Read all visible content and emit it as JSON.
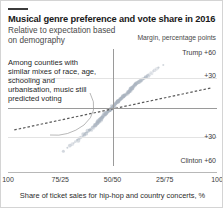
{
  "chart_data": {
    "type": "scatter",
    "title": "Musical genre preference and vote share in 2016",
    "subtitle": "Relative to expectation based on demography",
    "unit_label": "Margin, percentage points",
    "xlabel": "Share of ticket sales for hip-hop and country concerts, %",
    "ylabel": "Margin, percentage points",
    "annotation": "Among counties with similar mixes of race, age, schooling and urbanisation, music still predicted voting",
    "x_ticks": [
      "100",
      "75/25",
      "50/50",
      "25/75",
      "100"
    ],
    "x_tick_positions": [
      0,
      25,
      50,
      75,
      100
    ],
    "y_ticks": [
      "Trump +60",
      "+30",
      "+30",
      "Clinton +60"
    ],
    "y_tick_values": [
      60,
      30,
      -30,
      -60
    ],
    "ylim": [
      -60,
      60
    ],
    "xlim": [
      0,
      100
    ],
    "grid": true,
    "legend": "none",
    "point_color": "#aab4c0",
    "trend_color": "#5a5a5a",
    "axis_color": "#9a9a9a",
    "accent_color": "#3b3b3b",
    "trend_line": {
      "style": "dashed",
      "x_start": 3,
      "y_start": -23,
      "x_end": 97,
      "y_end": 20
    },
    "points": [
      {
        "x": 50.8,
        "y": 3.1
      },
      {
        "x": 47.2,
        "y": -5.4
      },
      {
        "x": 53.6,
        "y": 8.2
      },
      {
        "x": 44.1,
        "y": -11.3
      },
      {
        "x": 56.9,
        "y": 14.7
      },
      {
        "x": 49.5,
        "y": 1.8
      },
      {
        "x": 41.3,
        "y": -17.2
      },
      {
        "x": 58.4,
        "y": 19.6
      },
      {
        "x": 52.2,
        "y": 6.5
      },
      {
        "x": 46.7,
        "y": -7.9
      },
      {
        "x": 55.1,
        "y": 11.4
      },
      {
        "x": 43.0,
        "y": -14.1
      },
      {
        "x": 60.2,
        "y": 22.8
      },
      {
        "x": 48.3,
        "y": -2.6
      },
      {
        "x": 51.7,
        "y": 4.9
      },
      {
        "x": 38.6,
        "y": -24.5
      },
      {
        "x": 62.7,
        "y": 26.3
      },
      {
        "x": 54.4,
        "y": 9.7
      },
      {
        "x": 45.2,
        "y": -9.8
      },
      {
        "x": 57.3,
        "y": 16.1
      },
      {
        "x": 50.1,
        "y": 0.4
      },
      {
        "x": 40.5,
        "y": -20.3
      },
      {
        "x": 59.6,
        "y": 21.2
      },
      {
        "x": 53.0,
        "y": 7.3
      },
      {
        "x": 47.8,
        "y": -4.1
      },
      {
        "x": 35.9,
        "y": -29.7
      },
      {
        "x": 65.1,
        "y": 30.4
      },
      {
        "x": 49.0,
        "y": -1.2
      },
      {
        "x": 52.8,
        "y": 5.8
      },
      {
        "x": 42.4,
        "y": -15.6
      },
      {
        "x": 61.0,
        "y": 24.1
      },
      {
        "x": 55.7,
        "y": 12.9
      },
      {
        "x": 44.8,
        "y": -10.5
      },
      {
        "x": 58.0,
        "y": 17.8
      },
      {
        "x": 50.5,
        "y": 2.2
      },
      {
        "x": 39.2,
        "y": -22.9
      },
      {
        "x": 63.4,
        "y": 27.6
      },
      {
        "x": 53.9,
        "y": 8.9
      },
      {
        "x": 46.1,
        "y": -6.7
      },
      {
        "x": 56.2,
        "y": 13.5
      },
      {
        "x": 48.7,
        "y": -3.3
      },
      {
        "x": 37.4,
        "y": -26.8
      },
      {
        "x": 66.8,
        "y": 33.1
      },
      {
        "x": 51.3,
        "y": 3.7
      },
      {
        "x": 43.7,
        "y": -12.8
      },
      {
        "x": 59.1,
        "y": 20.0
      },
      {
        "x": 54.9,
        "y": 10.6
      },
      {
        "x": 45.6,
        "y": -8.6
      },
      {
        "x": 57.8,
        "y": 15.3
      },
      {
        "x": 33.1,
        "y": -33.2
      },
      {
        "x": 68.3,
        "y": 35.8
      },
      {
        "x": 50.9,
        "y": 1.1
      },
      {
        "x": 52.5,
        "y": 6.0
      },
      {
        "x": 41.8,
        "y": -18.4
      },
      {
        "x": 60.7,
        "y": 23.3
      },
      {
        "x": 55.4,
        "y": 11.0
      },
      {
        "x": 47.5,
        "y": -5.1
      },
      {
        "x": 58.8,
        "y": 18.6
      },
      {
        "x": 49.8,
        "y": -0.5
      },
      {
        "x": 36.6,
        "y": -28.1
      },
      {
        "x": 64.2,
        "y": 28.9
      },
      {
        "x": 53.3,
        "y": 7.8
      },
      {
        "x": 44.4,
        "y": -13.4
      },
      {
        "x": 56.5,
        "y": 13.0
      },
      {
        "x": 48.0,
        "y": -3.9
      },
      {
        "x": 30.8,
        "y": -37.5
      },
      {
        "x": 70.1,
        "y": 38.2
      },
      {
        "x": 51.0,
        "y": 2.7
      },
      {
        "x": 42.9,
        "y": -16.0
      },
      {
        "x": 61.6,
        "y": 25.0
      },
      {
        "x": 54.1,
        "y": 9.2
      },
      {
        "x": 46.4,
        "y": -7.2
      },
      {
        "x": 57.0,
        "y": 14.2
      },
      {
        "x": 50.3,
        "y": 0.9
      },
      {
        "x": 34.5,
        "y": -31.0
      },
      {
        "x": 67.0,
        "y": 32.4
      },
      {
        "x": 52.9,
        "y": 6.8
      },
      {
        "x": 45.0,
        "y": -10.0
      },
      {
        "x": 59.4,
        "y": 19.1
      },
      {
        "x": 49.2,
        "y": -1.9
      },
      {
        "x": 39.8,
        "y": -21.6
      },
      {
        "x": 62.1,
        "y": 25.7
      },
      {
        "x": 55.9,
        "y": 12.1
      },
      {
        "x": 47.0,
        "y": -6.0
      },
      {
        "x": 58.6,
        "y": 17.0
      },
      {
        "x": 51.5,
        "y": 4.2
      },
      {
        "x": 32.2,
        "y": -35.1
      },
      {
        "x": 69.4,
        "y": 36.9
      },
      {
        "x": 53.7,
        "y": 8.5
      },
      {
        "x": 43.4,
        "y": -14.8
      },
      {
        "x": 60.4,
        "y": 22.0
      },
      {
        "x": 54.6,
        "y": 10.1
      },
      {
        "x": 46.9,
        "y": -5.8
      },
      {
        "x": 56.7,
        "y": 13.8
      },
      {
        "x": 48.5,
        "y": -2.9
      },
      {
        "x": 28.4,
        "y": -41.2
      },
      {
        "x": 72.0,
        "y": 41.0
      },
      {
        "x": 50.6,
        "y": 1.5
      },
      {
        "x": 41.0,
        "y": -19.2
      },
      {
        "x": 63.9,
        "y": 27.1
      },
      {
        "x": 55.0,
        "y": 11.6
      },
      {
        "x": 44.6,
        "y": -11.8
      },
      {
        "x": 57.6,
        "y": 15.8
      },
      {
        "x": 49.7,
        "y": -0.9
      },
      {
        "x": 37.9,
        "y": -25.4
      },
      {
        "x": 65.7,
        "y": 30.8
      },
      {
        "x": 52.0,
        "y": 5.2
      },
      {
        "x": 45.8,
        "y": -9.1
      },
      {
        "x": 59.9,
        "y": 20.6
      },
      {
        "x": 53.5,
        "y": 8.0
      },
      {
        "x": 40.0,
        "y": -23.5
      },
      {
        "x": 61.3,
        "y": 24.6
      },
      {
        "x": 54.8,
        "y": 10.8
      },
      {
        "x": 47.6,
        "y": -4.6
      },
      {
        "x": 58.2,
        "y": 16.5
      },
      {
        "x": 50.0,
        "y": 0.0
      },
      {
        "x": 35.2,
        "y": -30.2
      },
      {
        "x": 66.4,
        "y": 31.6
      },
      {
        "x": 52.6,
        "y": 6.3
      },
      {
        "x": 43.2,
        "y": -15.1
      },
      {
        "x": 60.9,
        "y": 23.7
      },
      {
        "x": 55.5,
        "y": 12.5
      },
      {
        "x": 46.2,
        "y": -8.0
      },
      {
        "x": 57.4,
        "y": 14.9
      },
      {
        "x": 48.9,
        "y": -2.0
      },
      {
        "x": 26.5,
        "y": -44.8
      },
      {
        "x": 74.3,
        "y": 43.6
      },
      {
        "x": 51.9,
        "y": 4.5
      },
      {
        "x": 42.0,
        "y": -17.6
      },
      {
        "x": 62.5,
        "y": 26.0
      },
      {
        "x": 53.2,
        "y": 7.0
      },
      {
        "x": 45.4,
        "y": -9.4
      },
      {
        "x": 58.9,
        "y": 18.0
      },
      {
        "x": 49.4,
        "y": -1.5
      },
      {
        "x": 38.1,
        "y": -24.0
      },
      {
        "x": 64.7,
        "y": 29.4
      },
      {
        "x": 51.1,
        "y": 2.9
      },
      {
        "x": 44.0,
        "y": -13.0
      },
      {
        "x": 56.0,
        "y": 12.6
      },
      {
        "x": 47.3,
        "y": -4.9
      },
      {
        "x": 31.5,
        "y": -36.3
      },
      {
        "x": 68.9,
        "y": 34.5
      },
      {
        "x": 52.3,
        "y": 5.6
      },
      {
        "x": 46.6,
        "y": -7.5
      },
      {
        "x": 59.2,
        "y": 19.4
      },
      {
        "x": 50.7,
        "y": 2.4
      },
      {
        "x": 36.0,
        "y": -27.3
      },
      {
        "x": 63.0,
        "y": 26.6
      },
      {
        "x": 54.3,
        "y": 9.5
      },
      {
        "x": 45.9,
        "y": -8.3
      },
      {
        "x": 57.1,
        "y": 14.0
      },
      {
        "x": 48.2,
        "y": -3.5
      },
      {
        "x": 29.6,
        "y": -39.0
      },
      {
        "x": 71.2,
        "y": 39.7
      },
      {
        "x": 50.4,
        "y": 1.3
      },
      {
        "x": 40.8,
        "y": -20.8
      },
      {
        "x": 61.9,
        "y": 25.3
      },
      {
        "x": 55.8,
        "y": 12.3
      },
      {
        "x": 43.9,
        "y": -12.3
      },
      {
        "x": 58.5,
        "y": 17.4
      },
      {
        "x": 49.1,
        "y": -2.3
      },
      {
        "x": 34.0,
        "y": -32.0
      },
      {
        "x": 67.6,
        "y": 33.6
      },
      {
        "x": 53.8,
        "y": 8.7
      },
      {
        "x": 44.9,
        "y": -10.8
      },
      {
        "x": 56.4,
        "y": 13.2
      },
      {
        "x": 51.6,
        "y": 3.9
      },
      {
        "x": 39.5,
        "y": -22.2
      },
      {
        "x": 60.0,
        "y": 21.6
      },
      {
        "x": 54.0,
        "y": 9.0
      },
      {
        "x": 46.0,
        "y": -6.4
      },
      {
        "x": 57.9,
        "y": 16.3
      },
      {
        "x": 48.6,
        "y": -3.0
      },
      {
        "x": 33.6,
        "y": -34.0
      },
      {
        "x": 65.4,
        "y": 29.9
      },
      {
        "x": 52.7,
        "y": 6.6
      },
      {
        "x": 42.6,
        "y": -16.4
      },
      {
        "x": 59.7,
        "y": 20.3
      },
      {
        "x": 55.2,
        "y": 11.2
      },
      {
        "x": 47.9,
        "y": -4.3
      },
      {
        "x": 62.9,
        "y": 26.9
      },
      {
        "x": 50.2,
        "y": 0.6
      },
      {
        "x": 37.0,
        "y": -26.0
      },
      {
        "x": 64.9,
        "y": 29.0
      },
      {
        "x": 53.4,
        "y": 7.6
      },
      {
        "x": 45.1,
        "y": -10.2
      },
      {
        "x": 58.3,
        "y": 16.8
      },
      {
        "x": 49.6,
        "y": -1.0
      },
      {
        "x": 41.5,
        "y": -18.8
      },
      {
        "x": 66.0,
        "y": 31.2
      },
      {
        "x": 52.4,
        "y": 5.4
      },
      {
        "x": 43.5,
        "y": -14.4
      },
      {
        "x": 60.6,
        "y": 22.5
      },
      {
        "x": 55.6,
        "y": 11.8
      },
      {
        "x": 46.5,
        "y": -7.0
      },
      {
        "x": 57.5,
        "y": 15.0
      },
      {
        "x": 51.2,
        "y": 3.4
      },
      {
        "x": 38.9,
        "y": -23.2
      }
    ]
  }
}
